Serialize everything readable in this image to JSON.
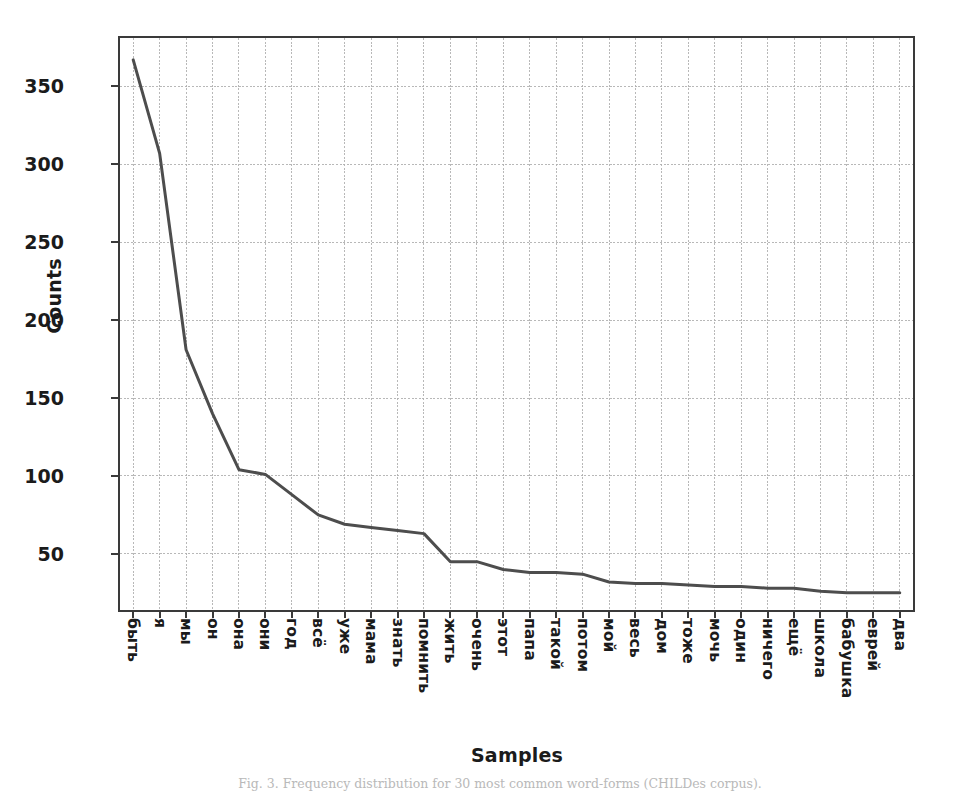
{
  "figure": {
    "caption": "Fig. 3. Frequency distribution for 30 most common word-forms (CHILDes corpus)."
  },
  "chart_data": {
    "type": "line",
    "title": "",
    "xlabel": "Samples",
    "ylabel": "Counts",
    "categories": [
      "быть",
      "я",
      "мы",
      "он",
      "она",
      "они",
      "год",
      "всё",
      "уже",
      "мама",
      "знать",
      "помнить",
      "жить",
      "очень",
      "этот",
      "папа",
      "такой",
      "потом",
      "мой",
      "весь",
      "дом",
      "тоже",
      "мочь",
      "один",
      "ничего",
      "ещё",
      "школа",
      "бабушка",
      "еврей",
      "два"
    ],
    "values": [
      367,
      307,
      181,
      140,
      104,
      101,
      88,
      75,
      69,
      67,
      65,
      63,
      45,
      45,
      40,
      38,
      38,
      37,
      32,
      31,
      31,
      30,
      29,
      29,
      28,
      28,
      26,
      25,
      25,
      25
    ],
    "yticks": [
      50,
      100,
      150,
      200,
      250,
      300,
      350
    ],
    "ytick_labels": [
      "50",
      "100",
      "150",
      "200",
      "250",
      "300",
      "350"
    ],
    "ylim": [
      14,
      381
    ],
    "xlim": [
      -0.5,
      29.5
    ],
    "grid": true,
    "grid_color": "#b0b0b0",
    "line_color": "#4d4d4d",
    "line_width": 3.0,
    "legend": null,
    "background": "#ffffff",
    "axis_color": "#3a3a3a"
  }
}
